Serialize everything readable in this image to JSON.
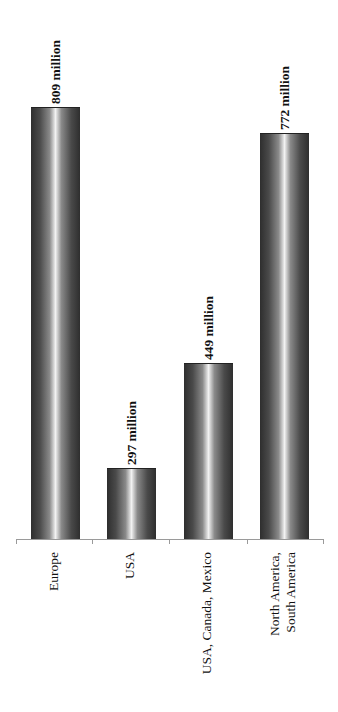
{
  "chart_data": {
    "type": "bar",
    "orientation": "vertical (rendered rotated page; labels rotated -90deg)",
    "title": "",
    "xlabel": "",
    "ylabel": "",
    "categories": [
      "Europe",
      "USA",
      "USA, Canada, Mexico",
      "North America,\nSouth America"
    ],
    "values": [
      809,
      297,
      449,
      772
    ],
    "value_labels": [
      "809 million",
      "297 million",
      "449 million",
      "772 million"
    ],
    "unit": "million",
    "ylim": [
      0,
      900
    ],
    "grid": false,
    "legend": null,
    "bar_style": "cylindrical gray gradient"
  },
  "labels": {
    "values": [
      "809 million",
      "297 million",
      "449 million",
      "772 million"
    ],
    "categories": [
      "Europe",
      "USA",
      "USA, Canada, Mexico",
      "North America,\nSouth America"
    ]
  }
}
